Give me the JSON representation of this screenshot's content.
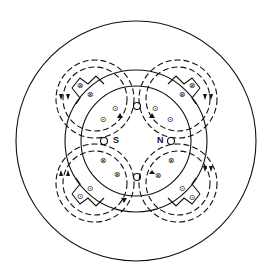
{
  "diagram": {
    "type": "four-pole machine cross-section with flux paths",
    "labels": {
      "south_pole": "S",
      "north_pole": "N"
    },
    "symbols": {
      "current_into_page": "⊗",
      "current_out_of_page": "⊙"
    },
    "colors": {
      "line": "#111111",
      "background": "#ffffff"
    }
  }
}
